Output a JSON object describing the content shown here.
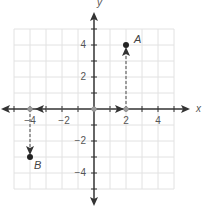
{
  "diagram": {
    "type": "coordinate-plane",
    "x_axis_label": "x",
    "y_axis_label": "y",
    "range": {
      "xmin": -5,
      "xmax": 5,
      "ymin": -5,
      "ymax": 5
    },
    "x_tick_labels": [
      {
        "value": -4,
        "label": "−4"
      },
      {
        "value": -2,
        "label": "−2"
      },
      {
        "value": 2,
        "label": "2"
      },
      {
        "value": 4,
        "label": "4"
      }
    ],
    "y_tick_labels": [
      {
        "value": 4,
        "label": "4"
      },
      {
        "value": 2,
        "label": "2"
      },
      {
        "value": -2,
        "label": "−2"
      },
      {
        "value": -4,
        "label": "−4"
      }
    ],
    "points": [
      {
        "name": "A",
        "x": 2,
        "y": 4
      },
      {
        "name": "B",
        "x": -4,
        "y": -3
      }
    ],
    "dashed_paths": [
      {
        "from": [
          0,
          0
        ],
        "to": [
          2,
          0
        ],
        "description": "origin to x=2 along x-axis"
      },
      {
        "from": [
          2,
          0
        ],
        "to": [
          2,
          4
        ],
        "description": "up to point A"
      },
      {
        "from": [
          0,
          0
        ],
        "to": [
          -4,
          0
        ],
        "description": "origin to x=-4 along x-axis"
      },
      {
        "from": [
          -4,
          0
        ],
        "to": [
          -4,
          -3
        ],
        "description": "down to point B"
      }
    ],
    "colors": {
      "axis": "#333333",
      "grid": "#e2e2e2",
      "dashed": "#666666",
      "point": "#222222",
      "hollow_point": "#999999"
    }
  }
}
